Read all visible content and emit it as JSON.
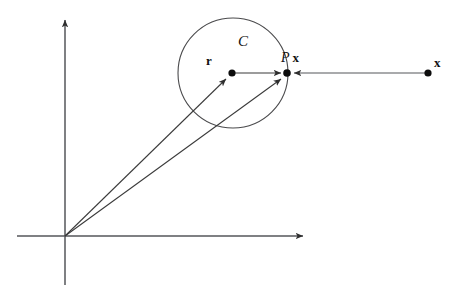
{
  "figure": {
    "kind": "geometry-diagram",
    "width": 457,
    "height": 296,
    "background_color": "#ffffff",
    "stroke_color": "#3a3a3a",
    "text_color": "#101010"
  },
  "labels": {
    "circle_label": "C",
    "center_vector_label": "r",
    "projection_label_operator": "P",
    "projection_label_vector": "x",
    "point_label": "x"
  },
  "axes": {
    "origin": {
      "x": 65,
      "y": 236
    },
    "x_axis": {
      "x1": 17,
      "y1": 236,
      "x2": 310,
      "y2": 236,
      "arrow": "right"
    },
    "y_axis": {
      "x1": 65,
      "y1": 285,
      "x2": 65,
      "y2": 13,
      "arrow": "up"
    }
  },
  "shapes": {
    "circle": {
      "cx": 233,
      "cy": 73,
      "r": 55,
      "label": "C"
    }
  },
  "points": [
    {
      "name": "center-point",
      "x": 232,
      "y": 73,
      "label": "r",
      "radius": 3.6
    },
    {
      "name": "projection-point",
      "x": 287,
      "y": 73,
      "label": "P x",
      "radius": 3.6
    },
    {
      "name": "exterior-point",
      "x": 428,
      "y": 73,
      "label": "x",
      "radius": 3.6
    }
  ],
  "vectors": [
    {
      "name": "origin-to-center",
      "x1": 65,
      "y1": 236,
      "x2": 229,
      "y2": 76,
      "arrow": "end"
    },
    {
      "name": "origin-to-projection",
      "x1": 65,
      "y1": 236,
      "x2": 284,
      "y2": 76,
      "arrow": "end"
    },
    {
      "name": "center-to-projection",
      "x1": 234,
      "y1": 73,
      "x2": 285,
      "y2": 73,
      "arrow": "end"
    },
    {
      "name": "exterior-to-projection",
      "x1": 427,
      "y1": 73,
      "x2": 291,
      "y2": 73,
      "arrow": "end"
    }
  ]
}
